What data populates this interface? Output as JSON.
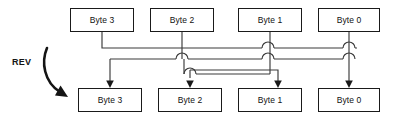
{
  "diagram": {
    "label": "REV",
    "stroke_color": "#3a3a3a",
    "box_border_color": "#1a1a1a",
    "background": "#ffffff",
    "source_row": [
      {
        "label": "Byte 3",
        "x": 70,
        "y": 8,
        "w": 64,
        "h": 24
      },
      {
        "label": "Byte 2",
        "x": 150,
        "y": 8,
        "w": 64,
        "h": 24
      },
      {
        "label": "Byte 1",
        "x": 238,
        "y": 8,
        "w": 64,
        "h": 24
      },
      {
        "label": "Byte 0",
        "x": 318,
        "y": 8,
        "w": 62,
        "h": 24
      }
    ],
    "dest_row": [
      {
        "label": "Byte 3",
        "x": 78,
        "y": 88,
        "w": 64,
        "h": 24
      },
      {
        "label": "Byte 2",
        "x": 158,
        "y": 88,
        "w": 64,
        "h": 24
      },
      {
        "label": "Byte 1",
        "x": 238,
        "y": 88,
        "w": 64,
        "h": 24
      },
      {
        "label": "Byte 0",
        "x": 318,
        "y": 88,
        "w": 62,
        "h": 24
      }
    ],
    "mapping": [
      {
        "from": "Byte 3",
        "to": "Byte 0"
      },
      {
        "from": "Byte 2",
        "to": "Byte 1"
      },
      {
        "from": "Byte 1",
        "to": "Byte 2"
      },
      {
        "from": "Byte 0",
        "to": "Byte 3"
      }
    ]
  }
}
